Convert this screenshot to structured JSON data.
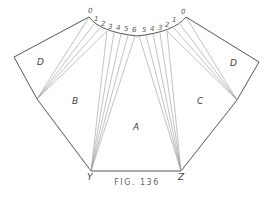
{
  "figure": {
    "caption": "FIG. 136",
    "regions": {
      "A": "A",
      "B": "B",
      "C": "C",
      "D_left": "D",
      "D_right": "D"
    },
    "vertices": {
      "Y": "Y",
      "Z": "Z"
    },
    "left_arc_ticks": [
      "0",
      "1",
      "2",
      "3",
      "4",
      "5",
      "6"
    ],
    "right_arc_ticks": [
      "0",
      "1",
      "2",
      "3",
      "4",
      "5"
    ],
    "colors": {
      "line": "#555555",
      "thin_line": "#999999",
      "background": "#ffffff"
    }
  }
}
